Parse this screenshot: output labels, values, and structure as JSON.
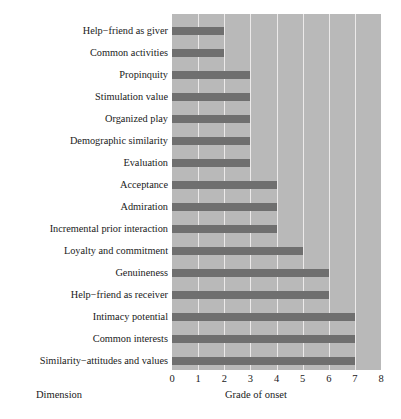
{
  "chart_data": {
    "type": "bar",
    "orientation": "horizontal",
    "title": "",
    "xlabel": "Grade of onset",
    "ylabel": "Dimension",
    "xlim": [
      0,
      8
    ],
    "xticks": [
      "0",
      "1",
      "2",
      "3",
      "4",
      "5",
      "6",
      "7",
      "8"
    ],
    "grid": "vertical",
    "legend": "none",
    "categories": [
      "Help−friend as giver",
      "Common activities",
      "Propinquity",
      "Stimulation value",
      "Organized play",
      "Demographic similarity",
      "Evaluation",
      "Acceptance",
      "Admiration",
      "Incremental prior interaction",
      "Loyalty and commitment",
      "Genuineness",
      "Help−friend as receiver",
      "Intimacy potential",
      "Common interests",
      "Similarity−attitudes and values"
    ],
    "values": [
      2,
      2,
      3,
      3,
      3,
      3,
      3,
      4,
      4,
      4,
      5,
      6,
      6,
      7,
      7,
      7
    ]
  },
  "style": {
    "bar_color": "#6f6f6f",
    "plot_background": "#b9b9b9",
    "gridline_color": "#eceaea",
    "figure_background": "#ffffff",
    "text_color": "#1a1a1a"
  }
}
